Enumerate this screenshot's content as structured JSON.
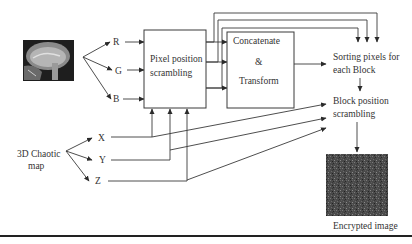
{
  "diagram": {
    "title": "",
    "nodes": {
      "input_image": {
        "label": "",
        "icon": "brain-mri-image"
      },
      "r": {
        "label": "R"
      },
      "g": {
        "label": "G"
      },
      "b": {
        "label": "B"
      },
      "pixel_scrambling": {
        "line1": "Pixel position",
        "line2": "scrambling"
      },
      "concat": {
        "line1": "Concatenate",
        "line2": "&",
        "line3": "Transform"
      },
      "sorting": {
        "line1": "Sorting pixels for",
        "line2": "each Block"
      },
      "block_scrambling": {
        "line1": "Block position",
        "line2": "scrambling"
      },
      "chaotic_map": {
        "line1": "3D Chaotic",
        "line2": "map"
      },
      "x": {
        "label": "X"
      },
      "y": {
        "label": "Y"
      },
      "z": {
        "label": "Z"
      },
      "encrypted": {
        "label": "Encrypted image",
        "icon": "noise-image"
      }
    },
    "edges": [
      {
        "from": "input_image",
        "to": "r"
      },
      {
        "from": "input_image",
        "to": "g"
      },
      {
        "from": "input_image",
        "to": "b"
      },
      {
        "from": "r",
        "to": "pixel_scrambling"
      },
      {
        "from": "g",
        "to": "pixel_scrambling"
      },
      {
        "from": "b",
        "to": "pixel_scrambling"
      },
      {
        "from": "pixel_scrambling",
        "to": "concat"
      },
      {
        "from": "pixel_scrambling",
        "to": "sorting"
      },
      {
        "from": "concat",
        "to": "sorting"
      },
      {
        "from": "sorting",
        "to": "block_scrambling"
      },
      {
        "from": "chaotic_map",
        "to": "x"
      },
      {
        "from": "chaotic_map",
        "to": "y"
      },
      {
        "from": "chaotic_map",
        "to": "z"
      },
      {
        "from": "x",
        "to": "pixel_scrambling"
      },
      {
        "from": "y",
        "to": "pixel_scrambling"
      },
      {
        "from": "z",
        "to": "pixel_scrambling"
      },
      {
        "from": "x",
        "to": "block_scrambling"
      },
      {
        "from": "y",
        "to": "block_scrambling"
      },
      {
        "from": "z",
        "to": "block_scrambling"
      },
      {
        "from": "block_scrambling",
        "to": "encrypted"
      }
    ]
  }
}
